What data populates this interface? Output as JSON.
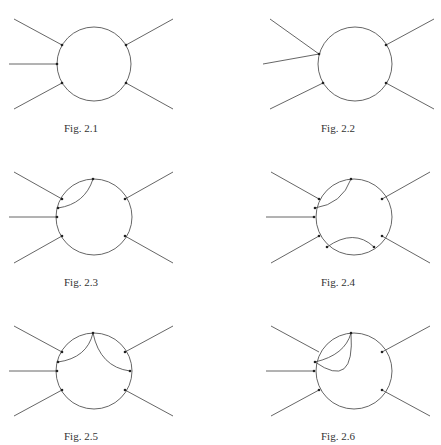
{
  "figures": [
    {
      "id": "fig-2-1",
      "caption": "Fig. 2.1"
    },
    {
      "id": "fig-2-2",
      "caption": "Fig. 2.2"
    },
    {
      "id": "fig-2-3",
      "caption": "Fig. 2.3"
    },
    {
      "id": "fig-2-4",
      "caption": "Fig. 2.4"
    },
    {
      "id": "fig-2-5",
      "caption": "Fig. 2.5"
    },
    {
      "id": "fig-2-6",
      "caption": "Fig. 2.6"
    }
  ],
  "style": {
    "line_color": "#555555",
    "vertex_color": "#222222",
    "background": "#ffffff"
  }
}
